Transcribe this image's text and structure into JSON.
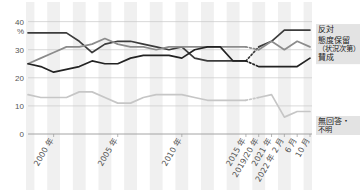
{
  "chart_data": {
    "type": "line",
    "title": "",
    "xlabel": "",
    "ylabel": "%",
    "ylim": [
      0,
      42
    ],
    "yticks": [
      0,
      10,
      20,
      30,
      40
    ],
    "ytick_labels": [
      "0",
      "10",
      "20",
      "30",
      "40"
    ],
    "unit": "%",
    "grid": true,
    "legend_position": "right",
    "banded_background": true,
    "x": [
      "1998",
      "1999",
      "2000",
      "2001",
      "2002",
      "2003",
      "2004",
      "2005",
      "2006",
      "2007",
      "2008",
      "2009",
      "2010",
      "2011",
      "2012",
      "2013",
      "2014",
      "2015",
      "2019/20",
      "2021",
      "2022/2",
      "2022/6",
      "2022/10"
    ],
    "xtick_labels": [
      "2000 年",
      "2005 年",
      "2010 年",
      "2015 年",
      "2019/20 年",
      "2021 年",
      "2022 年 2 月",
      "6 月",
      "10 月"
    ],
    "xtick_positions": [
      2,
      7,
      12,
      17,
      18,
      19,
      20,
      21,
      22
    ],
    "dotted_gap_from": 17,
    "dotted_gap_to": 18,
    "series": [
      {
        "name": "反対",
        "color": "#3c3c3c",
        "values": [
          36,
          36,
          36,
          36,
          33,
          29,
          32,
          33,
          33,
          32,
          31,
          30,
          31,
          27,
          26,
          26,
          26,
          26,
          31,
          33,
          37,
          37,
          37
        ]
      },
      {
        "name": "態度保留（状況次第）",
        "color": "#8c8c8c",
        "values": [
          25,
          27,
          29,
          31,
          31,
          32,
          34,
          32,
          31,
          31,
          30,
          31,
          31,
          31,
          31,
          31,
          31,
          31,
          30,
          33,
          30,
          33,
          31
        ]
      },
      {
        "name": "賛成",
        "color": "#232323",
        "values": [
          25,
          24,
          22,
          23,
          24,
          26,
          25,
          25,
          27,
          28,
          28,
          28,
          27,
          30,
          31,
          31,
          26,
          26,
          24,
          24,
          24,
          24,
          27
        ]
      },
      {
        "name": "無回答・不明",
        "color": "#c6c6c6",
        "values": [
          14,
          13,
          13,
          13,
          15,
          15,
          13,
          11,
          11,
          13,
          14,
          14,
          14,
          13,
          12,
          12,
          12,
          12,
          13,
          14,
          6,
          8,
          8
        ]
      }
    ]
  },
  "legend": {
    "items": [
      {
        "label": "反対",
        "color": "#3c3c3c"
      },
      {
        "label": "態度保留",
        "label2": "（状況次第）",
        "color": "#8c8c8c"
      },
      {
        "label": "賛成",
        "color": "#232323"
      },
      {
        "label": "無回答・",
        "label2": "不明",
        "color": "#c6c6c6"
      }
    ]
  },
  "axis": {
    "y_unit": "%",
    "y0": "0",
    "y10": "10",
    "y20": "20",
    "y30": "30",
    "y40": "40",
    "x0": "2000 年",
    "x1": "2005 年",
    "x2": "2010 年",
    "x3": "2015 年",
    "x4": "2019/20 年",
    "x5": "2021 年",
    "x6": "2022 年 2 月",
    "x7": "6 月",
    "x8": "10 月"
  }
}
